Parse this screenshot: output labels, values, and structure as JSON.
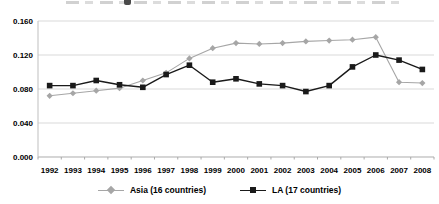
{
  "chart_data": {
    "type": "line",
    "title": "",
    "title_note_visible": false,
    "categories": [
      "1992",
      "1993",
      "1994",
      "1995",
      "1996",
      "1997",
      "1998",
      "1999",
      "2000",
      "2001",
      "2002",
      "2003",
      "2004",
      "2005",
      "2006",
      "2007",
      "2008"
    ],
    "series": [
      {
        "name": "Asia (16 countries)",
        "color": "#a6a6a6",
        "marker": "diamond",
        "values": [
          0.072,
          0.075,
          0.078,
          0.081,
          0.09,
          0.099,
          0.116,
          0.128,
          0.134,
          0.133,
          0.134,
          0.136,
          0.137,
          0.138,
          0.141,
          0.088,
          0.087
        ]
      },
      {
        "name": "LA (17 countries)",
        "color": "#1a1a1a",
        "marker": "square",
        "values": [
          0.084,
          0.084,
          0.09,
          0.085,
          0.082,
          0.097,
          0.108,
          0.088,
          0.092,
          0.086,
          0.084,
          0.077,
          0.084,
          0.106,
          0.12,
          0.114,
          0.103
        ]
      }
    ],
    "xlabel": "",
    "ylabel": "",
    "ylim": [
      0,
      0.16
    ],
    "yticks": [
      0,
      0.04,
      0.08,
      0.12,
      0.16
    ],
    "ytick_labels": [
      "0.000",
      "0.040",
      "0.080",
      "0.120",
      "0.160"
    ],
    "grid": "horizontal",
    "legend_position": "bottom",
    "colors": {
      "gridline": "#d9d9d9",
      "axis": "#bfbfbf",
      "tick": "#a9a9a9",
      "label": "#000000",
      "background": "#ffffff"
    }
  }
}
